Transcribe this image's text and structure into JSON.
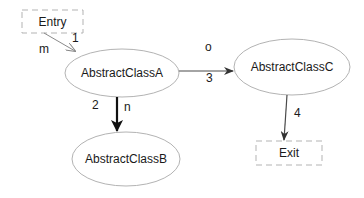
{
  "diagram": {
    "type": "state-flow",
    "nodes": [
      {
        "id": "entry",
        "label": "Entry",
        "shape": "dashed-rect",
        "x": 22,
        "y": 10,
        "w": 61,
        "h": 23
      },
      {
        "id": "a",
        "label": "AbstractClassA",
        "shape": "ellipse",
        "cx": 122,
        "cy": 73,
        "rx": 57,
        "ry": 24
      },
      {
        "id": "b",
        "label": "AbstractClassB",
        "shape": "ellipse",
        "cx": 126,
        "cy": 159,
        "rx": 54,
        "ry": 27
      },
      {
        "id": "c",
        "label": "AbstractClassC",
        "shape": "ellipse",
        "cx": 292,
        "cy": 67,
        "rx": 58,
        "ry": 28
      },
      {
        "id": "exit",
        "label": "Exit",
        "shape": "dashed-rect",
        "x": 256,
        "y": 141,
        "w": 66,
        "h": 24
      }
    ],
    "edges": [
      {
        "from": "entry",
        "to": "a",
        "order": "1",
        "label": "m"
      },
      {
        "from": "a",
        "to": "b",
        "order": "2",
        "label": "n"
      },
      {
        "from": "a",
        "to": "c",
        "order": "3",
        "label": "o"
      },
      {
        "from": "c",
        "to": "exit",
        "order": "4",
        "label": ""
      }
    ]
  },
  "colors": {
    "node_stroke": "#b3b3b3",
    "edge": "#4a4a4a",
    "edge_emphasis": "#111111",
    "text": "#1a1a1a"
  }
}
